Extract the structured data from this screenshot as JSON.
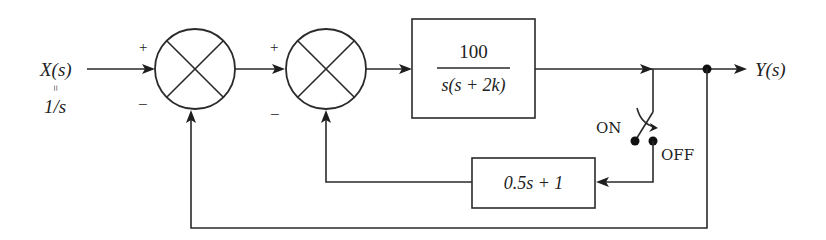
{
  "diagram": {
    "type": "block-diagram",
    "input": {
      "label": "X(s)",
      "equals_symbol": "=",
      "value": "1/s"
    },
    "output": {
      "label": "Y(s)"
    },
    "summing_junction_1": {
      "plus": "+",
      "minus": "−"
    },
    "summing_junction_2": {
      "plus": "+",
      "minus": "−"
    },
    "forward_block": {
      "numerator": "100",
      "denominator": "s(s + 2k)"
    },
    "feedback_block": {
      "expression": "0.5s + 1"
    },
    "switch": {
      "on_label": "ON",
      "off_label": "OFF"
    },
    "colors": {
      "line": "#2a2a2a",
      "background": "#ffffff"
    }
  }
}
